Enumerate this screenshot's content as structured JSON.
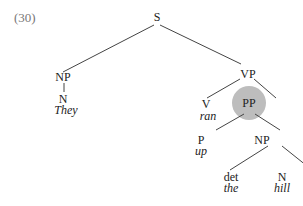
{
  "example_number": "(30)",
  "highlight_color": "#bdbdbd",
  "nodes": {
    "s": "S",
    "np1": "NP",
    "n1": "N",
    "they": "They",
    "vp": "VP",
    "v": "V",
    "ran": "ran",
    "pp": "PP",
    "p": "P",
    "up": "up",
    "np2": "NP",
    "det": "det",
    "the": "the",
    "n2": "N",
    "hill": "hill"
  }
}
